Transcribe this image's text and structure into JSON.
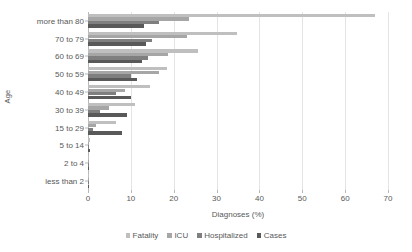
{
  "chart_data": {
    "type": "bar",
    "orientation": "horizontal",
    "title": "",
    "xlabel": "Diagnoses (%)",
    "ylabel": "Age",
    "xlim": [
      0,
      70
    ],
    "xticks": [
      0,
      10,
      20,
      30,
      40,
      50,
      60,
      70
    ],
    "grid": true,
    "legend_position": "bottom",
    "categories": [
      "more than 80",
      "70 to 79",
      "60 to 69",
      "50 to 59",
      "40 to 49",
      "30 to 39",
      "15 to 29",
      "5 to 14",
      "2 to 4",
      "less than 2"
    ],
    "series": [
      {
        "name": "Fatality",
        "color": "#bfbfbf",
        "values": [
          67.0,
          34.8,
          25.6,
          18.4,
          14.5,
          11.0,
          6.5,
          0.4,
          0.2,
          0.2
        ]
      },
      {
        "name": "ICU",
        "color": "#a6a6a6",
        "values": [
          23.5,
          23.2,
          18.6,
          16.5,
          8.7,
          4.8,
          1.8,
          0.3,
          0.2,
          0.2
        ]
      },
      {
        "name": "Hospitalized",
        "color": "#7f7f7f",
        "values": [
          16.5,
          15.0,
          14.0,
          10.0,
          6.5,
          2.8,
          1.2,
          0.2,
          0.2,
          0.2
        ]
      },
      {
        "name": "Cases",
        "color": "#595959",
        "values": [
          13.0,
          13.6,
          12.7,
          11.4,
          10.0,
          9.0,
          8.0,
          0.5,
          0.2,
          0.2
        ]
      }
    ]
  },
  "legend": {
    "items": [
      {
        "label": "Fatality",
        "color": "#bfbfbf"
      },
      {
        "label": "ICU",
        "color": "#a6a6a6"
      },
      {
        "label": "Hospitalized",
        "color": "#7f7f7f"
      },
      {
        "label": "Cases",
        "color": "#595959"
      }
    ]
  }
}
